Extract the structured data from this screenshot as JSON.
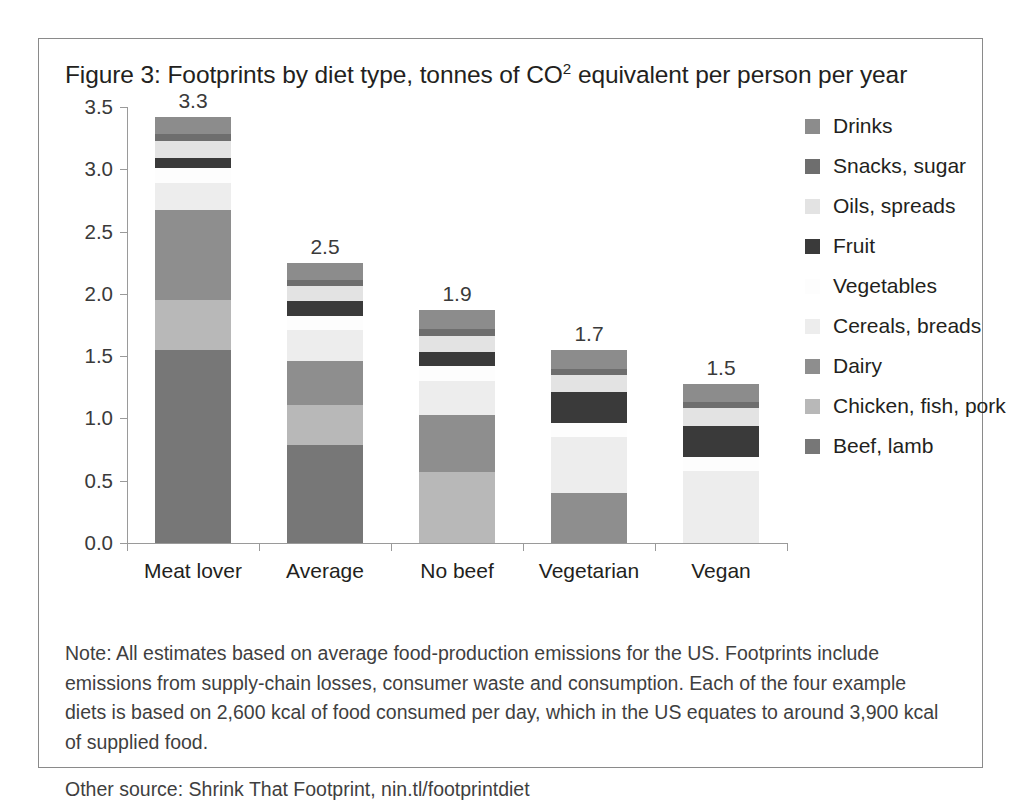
{
  "figure": {
    "title_prefix": "Figure 3: Footprints by diet type, tonnes of CO",
    "title_sup": "2",
    "title_suffix": " equivalent per person per year",
    "title_full": "Figure 3: Footprints by diet type, tonnes of CO2 equivalent per person per year"
  },
  "notes": {
    "note": "Note: All estimates based on average food-production emissions for the US. Footprints include emissions from supply-chain losses, consumer waste and consumption. Each of the four example diets is based on 2,600 kcal of food consumed per day, which in the US equates to around 3,900 kcal of supplied food.",
    "other_source": "Other source: Shrink That Footprint, nin.tl/footprintdiet"
  },
  "colors": {
    "drinks": "#8c8c8c",
    "snacks_sugar": "#6e6e6e",
    "oils_spreads": "#e3e3e3",
    "fruit": "#3a3a3a",
    "vegetables": "#fdfdfd",
    "cereals_breads": "#ededed",
    "dairy": "#8e8e8e",
    "chicken_fish_pork": "#b8b8b8",
    "beef_lamb": "#777777",
    "axis": "#9a9a9a",
    "text": "#231f20",
    "frame": "#8a8a8a"
  },
  "chart_data": {
    "type": "bar",
    "subtype": "stacked-vertical",
    "title": "Figure 3: Footprints by diet type, tonnes of CO2 equivalent per person per year",
    "xlabel": "",
    "ylabel": "",
    "ylim": [
      0.0,
      3.5
    ],
    "yticks": [
      "0.0",
      "0.5",
      "1.0",
      "1.5",
      "2.0",
      "2.5",
      "3.0",
      "3.5"
    ],
    "ytick_values": [
      0.0,
      0.5,
      1.0,
      1.5,
      2.0,
      2.5,
      3.0,
      3.5
    ],
    "grid": false,
    "legend_position": "right",
    "categories": [
      "Meat lover",
      "Average",
      "No beef",
      "Vegetarian",
      "Vegan"
    ],
    "bar_totals": [
      "3.3",
      "2.5",
      "1.9",
      "1.7",
      "1.5"
    ],
    "bar_total_values": [
      3.3,
      2.5,
      1.9,
      1.7,
      1.5
    ],
    "stack_order_bottom_to_top": [
      "Beef, lamb",
      "Chicken, fish, pork",
      "Dairy",
      "Cereals, breads",
      "Vegetables",
      "Fruit",
      "Oils, spreads",
      "Snacks, sugar",
      "Drinks"
    ],
    "series": [
      {
        "name": "Beef, lamb",
        "key": "beef_lamb",
        "color": "#777777",
        "values": [
          1.55,
          0.79,
          0.0,
          0.0,
          0.0
        ]
      },
      {
        "name": "Chicken, fish, pork",
        "key": "chicken_fish_pork",
        "color": "#b8b8b8",
        "values": [
          0.4,
          0.32,
          0.57,
          0.0,
          0.0
        ]
      },
      {
        "name": "Dairy",
        "key": "dairy",
        "color": "#8e8e8e",
        "values": [
          0.72,
          0.35,
          0.46,
          0.4,
          0.0
        ]
      },
      {
        "name": "Cereals, breads",
        "key": "cereals_breads",
        "color": "#ededed",
        "values": [
          0.22,
          0.25,
          0.27,
          0.45,
          0.58
        ]
      },
      {
        "name": "Vegetables",
        "key": "vegetables",
        "color": "#fdfdfd",
        "values": [
          0.12,
          0.11,
          0.12,
          0.11,
          0.11
        ]
      },
      {
        "name": "Fruit",
        "key": "fruit",
        "color": "#3a3a3a",
        "values": [
          0.08,
          0.12,
          0.11,
          0.25,
          0.25
        ]
      },
      {
        "name": "Oils, spreads",
        "key": "oils_spreads",
        "color": "#e3e3e3",
        "values": [
          0.14,
          0.12,
          0.13,
          0.14,
          0.14
        ]
      },
      {
        "name": "Snacks, sugar",
        "key": "snacks_sugar",
        "color": "#6e6e6e",
        "values": [
          0.05,
          0.05,
          0.06,
          0.05,
          0.05
        ]
      },
      {
        "name": "Drinks",
        "key": "drinks",
        "color": "#8c8c8c",
        "values": [
          0.14,
          0.14,
          0.15,
          0.15,
          0.15
        ]
      }
    ]
  },
  "legend": {
    "items": [
      {
        "label": "Drinks",
        "key": "drinks"
      },
      {
        "label": "Snacks, sugar",
        "key": "snacks_sugar"
      },
      {
        "label": "Oils, spreads",
        "key": "oils_spreads"
      },
      {
        "label": "Fruit",
        "key": "fruit"
      },
      {
        "label": "Vegetables",
        "key": "vegetables"
      },
      {
        "label": "Cereals, breads",
        "key": "cereals_breads"
      },
      {
        "label": "Dairy",
        "key": "dairy"
      },
      {
        "label": "Chicken, fish, pork",
        "key": "chicken_fish_pork"
      },
      {
        "label": "Beef, lamb",
        "key": "beef_lamb"
      }
    ]
  }
}
